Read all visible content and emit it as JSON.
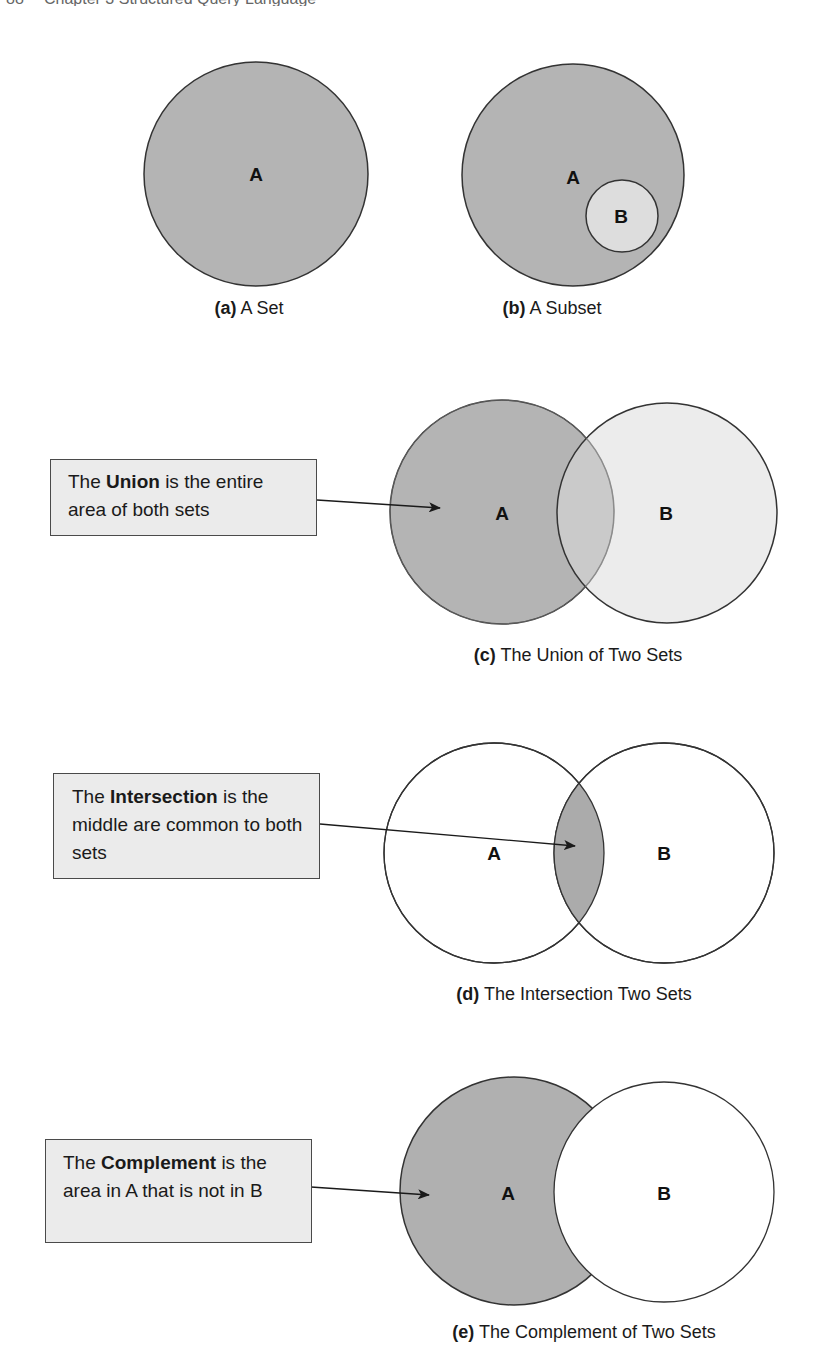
{
  "running_head": {
    "page_number": "88",
    "title": "Chapter 3  Structured Query Language"
  },
  "colors": {
    "set_fill_dark": "#b4b4b4",
    "set_fill_light": "#dddddd",
    "overlap_fill": "#aaaaaa",
    "outline": "#333333",
    "callout_bg": "#ebebeb"
  },
  "figures": {
    "a": {
      "letter": "(a)",
      "caption": "A Set",
      "label_a": "A"
    },
    "b": {
      "letter": "(b)",
      "caption": "A Subset",
      "label_a": "A",
      "label_b": "B"
    },
    "c": {
      "letter": "(c)",
      "caption": "The Union of Two Sets",
      "label_a": "A",
      "label_b": "B",
      "callout": {
        "pre": "The ",
        "term": "Union",
        "post": " is the entire area of both sets"
      }
    },
    "d": {
      "letter": "(d)",
      "caption": "The Intersection Two Sets",
      "label_a": "A",
      "label_b": "B",
      "callout": {
        "pre": "The ",
        "term": "Intersection",
        "post": " is the middle are common to both sets"
      }
    },
    "e": {
      "letter": "(e)",
      "caption": "The Complement of Two Sets",
      "label_a": "A",
      "label_b": "B",
      "callout": {
        "pre": "The ",
        "term": "Complement",
        "post": " is the area in A that is not in B"
      }
    }
  }
}
